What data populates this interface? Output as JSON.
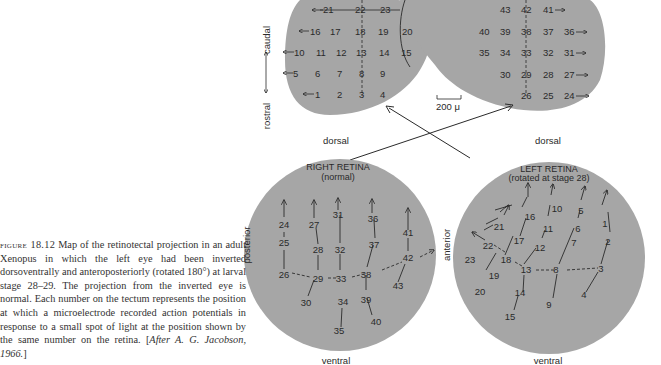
{
  "caption": {
    "label": "figure 18.12",
    "text": " Map of the retinotectal projection in an adult Xenopus in which the left eye had been inverted dorsoventrally and anteroposteriorly (rotated 180°) at larval stage 28–29. The projection from the inverted eye is normal. Each number on the tectum represents the position at which a microelectrode recorded action potentials in response to a small spot of light at the position shown by the same number on the retina. [",
    "cite": "After A. G. Jacobson, 1966.",
    "close": "]"
  },
  "tectum": {
    "axis_caudal": "caudal",
    "axis_rostral": "rostral",
    "scale_bar": "200 μ",
    "left_rows": [
      [
        "21",
        "22",
        "23"
      ],
      [
        "16",
        "17",
        "18",
        "19",
        "20"
      ],
      [
        "10",
        "11",
        "12",
        "13",
        "14",
        "15"
      ],
      [
        "5",
        "6",
        "7",
        "8",
        "9"
      ],
      [
        "1",
        "2",
        "3",
        "4"
      ]
    ],
    "right_rows": [
      [
        "43",
        "42",
        "41"
      ],
      [
        "40",
        "39",
        "38",
        "37",
        "36"
      ],
      [
        "35",
        "34",
        "33",
        "32",
        "31"
      ],
      [
        "30",
        "29",
        "28",
        "27"
      ],
      [
        "26",
        "25",
        "24"
      ]
    ]
  },
  "right_retina": {
    "title": "RIGHT RETINA",
    "subtitle": "(normal)",
    "top_label": "dorsal",
    "bottom_label": "ventral",
    "side_label": "posterior",
    "points": [
      "24",
      "25",
      "26",
      "27",
      "28",
      "29",
      "30",
      "31",
      "32",
      "33",
      "34",
      "35",
      "36",
      "37",
      "38",
      "39",
      "40",
      "41",
      "42",
      "43"
    ]
  },
  "left_retina": {
    "title": "LEFT RETINA",
    "subtitle": "(rotated at stage 28)",
    "top_label": "dorsal",
    "bottom_label": "ventral",
    "side_label": "anterior",
    "points": [
      "1",
      "2",
      "3",
      "4",
      "5",
      "6",
      "7",
      "8",
      "9",
      "10",
      "11",
      "12",
      "13",
      "14",
      "15",
      "16",
      "17",
      "18",
      "19",
      "20",
      "21",
      "22",
      "23"
    ]
  },
  "colors": {
    "shape_fill": "#a6a6a6",
    "ink": "#2a2a2a",
    "background": "#ffffff"
  }
}
